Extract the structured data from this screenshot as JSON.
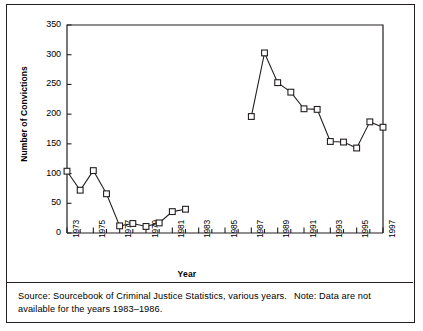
{
  "figure": {
    "axis_labels": {
      "y": "Number of Convictions",
      "x": "Year"
    },
    "note": {
      "source_text": "Source: Sourcebook of Criminal Justice Statistics, various years.",
      "note_text": "Note: Data are not available for the years 1983–1986."
    }
  },
  "chart_data": {
    "type": "line",
    "title": "",
    "xlabel": "Year",
    "ylabel": "Number of Convictions",
    "xlim": [
      1973,
      1997
    ],
    "ylim": [
      0,
      350
    ],
    "ytick_values": [
      0,
      50,
      100,
      150,
      200,
      250,
      300,
      350
    ],
    "ytick_labels": [
      "0",
      "50",
      "100",
      "150",
      "200",
      "250",
      "300",
      "350"
    ],
    "xtick_values": [
      1973,
      1974,
      1975,
      1976,
      1977,
      1978,
      1979,
      1980,
      1981,
      1982,
      1983,
      1984,
      1985,
      1986,
      1987,
      1988,
      1989,
      1990,
      1991,
      1992,
      1993,
      1994,
      1995,
      1996,
      1997
    ],
    "xtick_labeled": [
      1973,
      1975,
      1977,
      1979,
      1981,
      1983,
      1985,
      1987,
      1989,
      1991,
      1993,
      1995,
      1997
    ],
    "xtick_labels": [
      "1973",
      "1975",
      "1977",
      "1979",
      "1981",
      "1983",
      "1985",
      "1987",
      "1989",
      "1991",
      "1993",
      "1995",
      "1997"
    ],
    "grid": false,
    "legend": "none",
    "marker": "open-square",
    "line_color": "#231f20",
    "marker_color": "#231f20",
    "missing_years": [
      1983,
      1984,
      1985,
      1986
    ],
    "series": [
      {
        "name": "Number of Convictions",
        "x": [
          1973,
          1974,
          1975,
          1976,
          1977,
          1978,
          1979,
          1980,
          1981,
          1982,
          1987,
          1988,
          1989,
          1990,
          1991,
          1992,
          1993,
          1994,
          1995,
          1996,
          1997
        ],
        "values": [
          104,
          72,
          105,
          66,
          12,
          16,
          11,
          17,
          36,
          40,
          196,
          303,
          253,
          237,
          209,
          208,
          154,
          153,
          143,
          187,
          178
        ]
      }
    ]
  }
}
